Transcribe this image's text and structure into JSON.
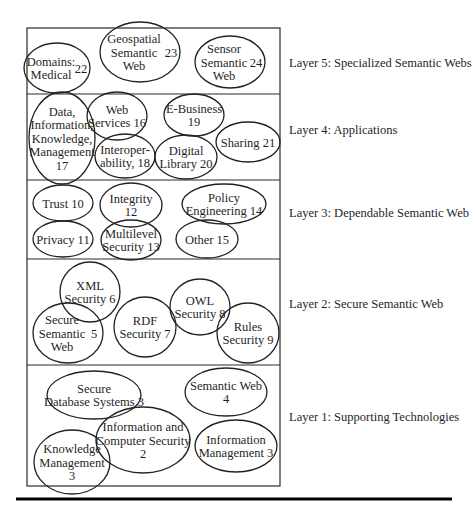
{
  "diagram": {
    "type": "layered-architecture",
    "frame": {
      "x": 27,
      "y": 28,
      "width": 253,
      "height": 458,
      "stroke": "#2a2a2a"
    },
    "bottom_rule": {
      "x1": 16,
      "x2": 452,
      "y": 499,
      "thickness": 3,
      "color": "#000000"
    },
    "layers": [
      {
        "id": "layer5",
        "label": "Layer 5: Specialized Semantic Webs",
        "top": 28,
        "bottom": 94,
        "label_y": 63,
        "nodes": [
          {
            "id": "n22",
            "lines": [
              "Domains:",
              "Medical"
            ],
            "number": "22",
            "cx": 57,
            "cy": 68,
            "rx": 33,
            "ry": 25,
            "number_pos": "right"
          },
          {
            "id": "n23",
            "lines": [
              "Geospatial",
              "Semantic",
              "Web"
            ],
            "number": "23",
            "cx": 140,
            "cy": 52,
            "rx": 40,
            "ry": 30,
            "number_pos": "right"
          },
          {
            "id": "n24",
            "lines": [
              "Sensor",
              "Semantic",
              "Web"
            ],
            "number": "24",
            "cx": 230,
            "cy": 62,
            "rx": 35,
            "ry": 26,
            "number_pos": "right"
          }
        ]
      },
      {
        "id": "layer4",
        "label": "Layer 4: Applications",
        "top": 94,
        "bottom": 180,
        "label_y": 130,
        "nodes": [
          {
            "id": "n17",
            "lines": [
              "Data,",
              "Information,",
              "Knowledge,",
              "Management",
              "17"
            ],
            "cx": 62,
            "cy": 138,
            "rx": 33,
            "ry": 46
          },
          {
            "id": "n16",
            "lines": [
              "Web",
              "Services 16"
            ],
            "cx": 117,
            "cy": 116,
            "rx": 30,
            "ry": 24
          },
          {
            "id": "n19",
            "lines": [
              "E-Business",
              "19"
            ],
            "cx": 194,
            "cy": 115,
            "rx": 30,
            "ry": 21
          },
          {
            "id": "n18",
            "lines": [
              "Interoper-",
              "ability, 18"
            ],
            "cx": 125,
            "cy": 156,
            "rx": 30,
            "ry": 22
          },
          {
            "id": "n20",
            "lines": [
              "Digital",
              "Library 20"
            ],
            "cx": 186,
            "cy": 157,
            "rx": 31,
            "ry": 22
          },
          {
            "id": "n21",
            "lines": [
              "Sharing 21"
            ],
            "cx": 248,
            "cy": 142,
            "rx": 32,
            "ry": 20
          }
        ]
      },
      {
        "id": "layer3",
        "label": "Layer 3: Dependable Semantic Web",
        "top": 180,
        "bottom": 259,
        "label_y": 213,
        "nodes": [
          {
            "id": "n10",
            "lines": [
              "Trust 10"
            ],
            "cx": 63,
            "cy": 203,
            "rx": 30,
            "ry": 18
          },
          {
            "id": "n12",
            "lines": [
              "Integrity",
              "12"
            ],
            "cx": 131,
            "cy": 205,
            "rx": 31,
            "ry": 22
          },
          {
            "id": "n14",
            "lines": [
              "Policy",
              "Engineering 14"
            ],
            "cx": 224,
            "cy": 204,
            "rx": 42,
            "ry": 20
          },
          {
            "id": "n11",
            "lines": [
              "Privacy 11"
            ],
            "cx": 63,
            "cy": 239,
            "rx": 30,
            "ry": 18
          },
          {
            "id": "n13",
            "lines": [
              "Multilevel",
              "Security 13"
            ],
            "cx": 131,
            "cy": 240,
            "rx": 30,
            "ry": 20
          },
          {
            "id": "n15",
            "lines": [
              "Other 15"
            ],
            "cx": 207,
            "cy": 239,
            "rx": 31,
            "ry": 19
          }
        ]
      },
      {
        "id": "layer2",
        "label": "Layer 2: Secure Semantic Web",
        "top": 259,
        "bottom": 365,
        "label_y": 304,
        "nodes": [
          {
            "id": "n6",
            "lines": [
              "XML",
              "Security 6"
            ],
            "cx": 90,
            "cy": 292,
            "rx": 30,
            "ry": 30
          },
          {
            "id": "n5",
            "lines": [
              "Secure",
              "Semantic",
              "Web"
            ],
            "number": "5",
            "cx": 68,
            "cy": 333,
            "rx": 35,
            "ry": 30,
            "number_pos": "right"
          },
          {
            "id": "n7",
            "lines": [
              "RDF",
              "Security 7"
            ],
            "cx": 145,
            "cy": 327,
            "rx": 31,
            "ry": 30
          },
          {
            "id": "n8",
            "lines": [
              "OWL",
              "Security 8"
            ],
            "cx": 200,
            "cy": 307,
            "rx": 30,
            "ry": 28
          },
          {
            "id": "n9",
            "lines": [
              "Rules",
              "Security 9"
            ],
            "cx": 248,
            "cy": 333,
            "rx": 31,
            "ry": 30
          }
        ]
      },
      {
        "id": "layer1",
        "label": "Layer 1: Supporting Technologies",
        "top": 365,
        "bottom": 486,
        "label_y": 417,
        "nodes": [
          {
            "id": "n3a",
            "lines": [
              "Secure",
              "Database Systems 3"
            ],
            "cx": 94,
            "cy": 395,
            "rx": 47,
            "ry": 24
          },
          {
            "id": "n4",
            "lines": [
              "Semantic Web",
              "4"
            ],
            "cx": 226,
            "cy": 392,
            "rx": 41,
            "ry": 24
          },
          {
            "id": "n2",
            "lines": [
              "Information and",
              "Computer Security",
              "2"
            ],
            "cx": 143,
            "cy": 440,
            "rx": 47,
            "ry": 33
          },
          {
            "id": "n3b",
            "lines": [
              "Information",
              "Management 3"
            ],
            "cx": 236,
            "cy": 446,
            "rx": 41,
            "ry": 26
          },
          {
            "id": "n3c",
            "lines": [
              "Knowledge",
              "Management",
              "3"
            ],
            "cx": 72,
            "cy": 462,
            "rx": 38,
            "ry": 32
          }
        ]
      }
    ]
  }
}
